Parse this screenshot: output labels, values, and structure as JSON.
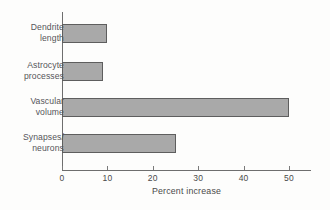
{
  "chart_data": {
    "type": "bar",
    "orientation": "horizontal",
    "title": "",
    "xlabel": "Percent increase",
    "ylabel": "",
    "categories": [
      "Dendrite\nlength",
      "Astrocyte\nprocesses",
      "Vascular\nvolume",
      "Synapses/\nneurons"
    ],
    "values": [
      10,
      9,
      50,
      25
    ],
    "xlim": [
      0,
      55
    ],
    "xticks": [
      0,
      10,
      20,
      30,
      40,
      50
    ],
    "xtick_labels": [
      "0",
      "10",
      "20",
      "30",
      "40",
      "50"
    ],
    "grid": false,
    "legend": null,
    "bar_fill_color": "#a9a9a9",
    "bar_edge_color": "#5e5e5e",
    "axis_color": "#6e6e6e",
    "text_color": "#55555a",
    "background_color": "#fdfdfc"
  }
}
